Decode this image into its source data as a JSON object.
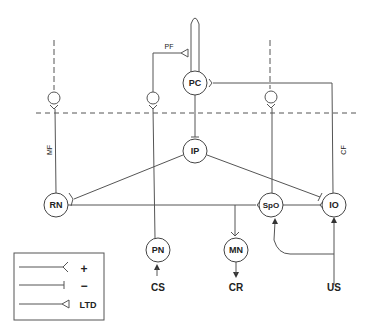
{
  "diagram": {
    "nodes": {
      "pc": {
        "label": "PC",
        "x": 195,
        "y": 83
      },
      "ip": {
        "label": "IP",
        "x": 195,
        "y": 151
      },
      "rn": {
        "label": "RN",
        "x": 56,
        "y": 205
      },
      "spo": {
        "label": "SpO",
        "x": 271,
        "y": 205
      },
      "io": {
        "label": "IO",
        "x": 334,
        "y": 205
      },
      "pn": {
        "label": "PN",
        "x": 158,
        "y": 250
      },
      "mn": {
        "label": "MN",
        "x": 236,
        "y": 250
      }
    },
    "fibers": {
      "mf": "MF",
      "pf": "PF",
      "cf": "CF"
    },
    "signals": {
      "cs": "CS",
      "cr": "CR",
      "us": "US"
    },
    "legend": {
      "items": [
        {
          "symbol": "fork",
          "label": "+"
        },
        {
          "symbol": "bar",
          "label": "−"
        },
        {
          "symbol": "triangle",
          "label": "LTD"
        }
      ]
    },
    "colors": {
      "line": "#555555",
      "text": "#222222",
      "background": "#ffffff"
    }
  }
}
